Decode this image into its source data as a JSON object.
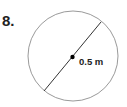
{
  "problem": {
    "number": "8.",
    "shape": "circle",
    "measurement_label": "0.5 m",
    "measurement_type": "diameter"
  }
}
